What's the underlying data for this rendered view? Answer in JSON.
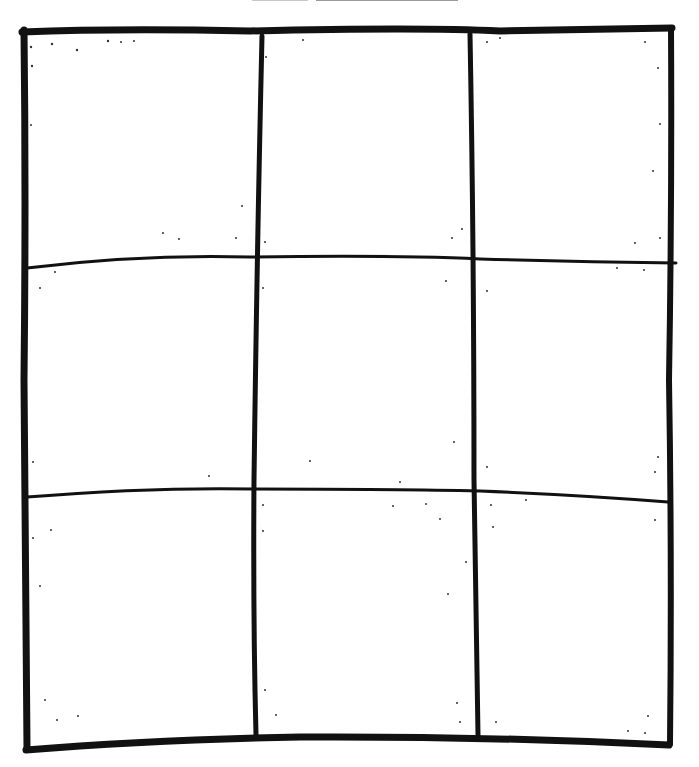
{
  "drawing": {
    "type": "hand-drawn grid",
    "rows": 3,
    "columns": 3,
    "stroke_color": "#111111",
    "background_color": "#ffffff",
    "top_label_line_color": "#9a9a9a"
  }
}
